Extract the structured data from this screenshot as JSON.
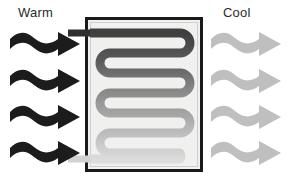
{
  "diagram": {
    "title_left": "Warm",
    "title_right": "Cool",
    "type": "heat-exchanger-schematic",
    "colors": {
      "warm_arrow": "#1c1c1c",
      "cool_arrow": "#bfbfbf",
      "box_border": "#1a1a1a",
      "box_fill": "#f0f0ee",
      "coil_hot": "#4a4a4a",
      "coil_mid": "#8c8c8c",
      "coil_cool": "#d8d8d8",
      "text": "#2b2b2b"
    },
    "box": {
      "x": 85,
      "y": 17,
      "width": 118,
      "height": 155,
      "border_width": 3
    },
    "inlet": {
      "name": "warm-inlet-pipe",
      "side": "top-left",
      "x": 68,
      "y": 30,
      "length": 22,
      "thickness": 7,
      "color": "#2e2e2e"
    },
    "outlet": {
      "name": "cool-outlet-pipe",
      "side": "bottom-left",
      "x": 68,
      "y": 156,
      "length": 22,
      "thickness": 7,
      "color": "#d2d2d2"
    },
    "coil": {
      "name": "serpentine-coil",
      "runs": 8,
      "stroke_width": 9,
      "gradient_stops": [
        {
          "offset": 0.0,
          "color": "#3f3f3f"
        },
        {
          "offset": 0.22,
          "color": "#5a5a5a"
        },
        {
          "offset": 0.45,
          "color": "#878787"
        },
        {
          "offset": 0.7,
          "color": "#aeaeae"
        },
        {
          "offset": 1.0,
          "color": "#dcdcdc"
        }
      ]
    },
    "warm_arrows": {
      "count": 4,
      "color": "#1c1c1c",
      "direction": "right",
      "style": "wavy",
      "positions_y": [
        30,
        67,
        103,
        139
      ],
      "x": 10,
      "width": 72,
      "height": 30
    },
    "cool_arrows": {
      "count": 4,
      "color": "#bfbfbf",
      "direction": "right",
      "style": "wavy",
      "positions_y": [
        30,
        67,
        103,
        139
      ],
      "x": 211,
      "width": 72,
      "height": 30
    }
  }
}
